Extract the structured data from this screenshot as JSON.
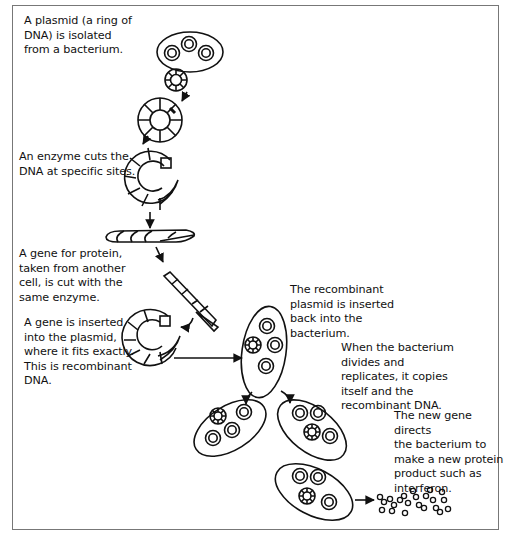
{
  "diagram": {
    "steps": [
      {
        "id": "isolate",
        "text": "A plasmid (a ring of\nDNA) is isolated\nfrom a bacterium."
      },
      {
        "id": "cut",
        "text": "An enzyme cuts the\nDNA at specific sites."
      },
      {
        "id": "gene",
        "text": "A gene for protein,\ntaken from another\ncell, is cut with the\nsame enzyme."
      },
      {
        "id": "insert",
        "text": "A gene is inserted\ninto the plasmid,\nwhere it fits exactly.\nThis is recombinant\nDNA."
      },
      {
        "id": "reinsert",
        "text": "The recombinant\nplasmid is inserted\nback into the\nbacterium."
      },
      {
        "id": "divide",
        "text": "When the bacterium\ndivides and\nreplicates, it copies\nitself and the\nrecombinant DNA."
      },
      {
        "id": "product",
        "text": "The new gene directs\nthe bacterium to\nmake a new protein\nproduct such as\ninterferon."
      }
    ],
    "icons": [
      "bacterium-icon",
      "plasmid-ring-icon",
      "cut-plasmid-icon",
      "dna-strand-icon",
      "gene-fragment-icon",
      "recombinant-plasmid-icon",
      "arrow-icon",
      "protein-molecules-icon"
    ],
    "colors": {
      "line": "#111111",
      "frame": "#777777",
      "background": "#ffffff"
    }
  }
}
